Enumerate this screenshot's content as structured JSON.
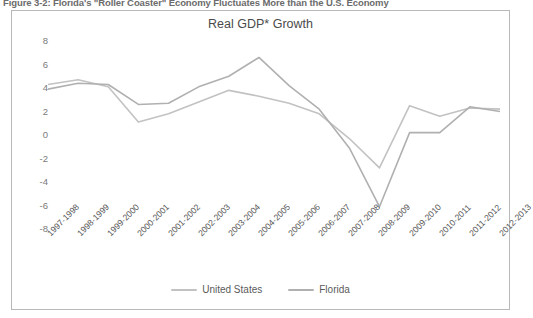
{
  "figure": {
    "caption": "Figure 3-2: Florida's \"Roller Coaster\" Economy Fluctuates More than the U.S. Economy"
  },
  "legend": {
    "position": "bottom-center",
    "entries": [
      {
        "label": "United States",
        "color": "#c2c2c2"
      },
      {
        "label": "Florida",
        "color": "#b0b0b0"
      }
    ]
  },
  "chart_data": {
    "type": "line",
    "title": "Real GDP* Growth",
    "xlabel": "",
    "ylabel": "",
    "ylim": [
      -8,
      8
    ],
    "yticks": [
      8,
      6,
      4,
      2,
      0,
      -2,
      -4,
      -6,
      -8
    ],
    "grid": false,
    "categories": [
      "1997-1998",
      "1998-1999",
      "1999-2000",
      "2000-2001",
      "2001-2002",
      "2002-2003",
      "2003-2004",
      "2004-2005",
      "2005-2006",
      "2006-2007",
      "2007-2008",
      "2008-2009",
      "2009-2010",
      "2010-2011",
      "2011-2012",
      "2012-2013"
    ],
    "series": [
      {
        "name": "United States",
        "color": "#c2c2c2",
        "values": [
          4.3,
          4.7,
          4.1,
          1.1,
          1.8,
          2.8,
          3.8,
          3.3,
          2.7,
          1.8,
          -0.3,
          -2.8,
          2.5,
          1.6,
          2.3,
          2.2
        ]
      },
      {
        "name": "Florida",
        "color": "#b0b0b0",
        "values": [
          3.9,
          4.4,
          4.3,
          2.6,
          2.7,
          4.1,
          5.0,
          6.6,
          4.2,
          2.2,
          -1.1,
          -6.1,
          0.2,
          0.2,
          2.4,
          2.0
        ]
      }
    ]
  }
}
